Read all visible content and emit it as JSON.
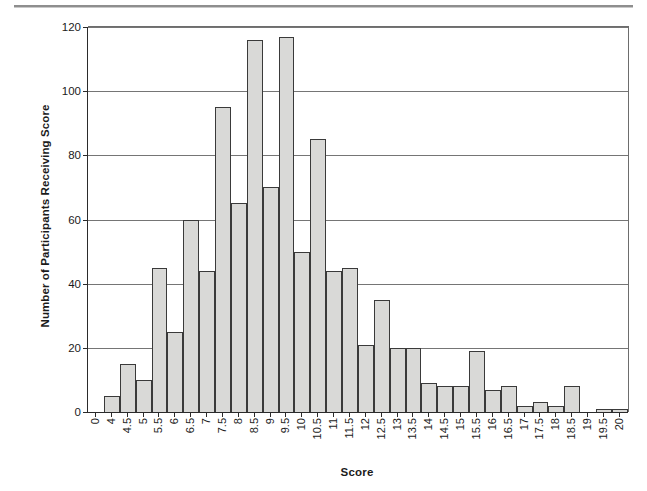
{
  "figure": {
    "ylabel_text": "Number of Participants Receiving Score",
    "xlabel_text": "Score"
  },
  "chart_data": {
    "type": "bar",
    "title": "",
    "subtitle": "",
    "xlabel": "Score",
    "ylabel": "Number of Participants Receiving Score",
    "ylim": [
      0,
      120
    ],
    "ytick_values": [
      0,
      20,
      40,
      60,
      80,
      100,
      120
    ],
    "ytick_labels": [
      "0",
      "20",
      "40",
      "60",
      "80",
      "100",
      "120"
    ],
    "grid": true,
    "legend": false,
    "legend_position": "none",
    "bar_fill_color": "#d9d9d7",
    "bar_border_color": "#3a3a3a",
    "categories": [
      "0",
      "4",
      "4.5",
      "5",
      "5.5",
      "6",
      "6.5",
      "7",
      "7.5",
      "8",
      "8.5",
      "9",
      "9.5",
      "10",
      "10.5",
      "11",
      "11.5",
      "12",
      "12.5",
      "13",
      "13.5",
      "14",
      "14.5",
      "15",
      "15.5",
      "16",
      "16.5",
      "17",
      "17.5",
      "18",
      "18.5",
      "19",
      "19.5",
      "20"
    ],
    "values": [
      0,
      5,
      15,
      10,
      45,
      25,
      60,
      44,
      95,
      65,
      116,
      70,
      117,
      50,
      85,
      44,
      45,
      21,
      35,
      20,
      20,
      9,
      8,
      8,
      19,
      7,
      8,
      2,
      3,
      2,
      8,
      0,
      1,
      1
    ]
  }
}
